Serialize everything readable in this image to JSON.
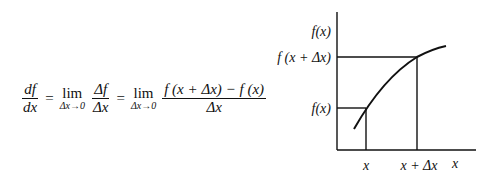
{
  "formula": {
    "lhs_num": "df",
    "lhs_den": "dx",
    "eq1": "=",
    "lim1_word": "lim",
    "lim1_sub": "Δx→0",
    "frac2_num": "Δf",
    "frac2_den": "Δx",
    "eq2": "=",
    "lim2_word": "lim",
    "lim2_sub": "Δx→0",
    "frac3_num": "f (x + Δx) − f (x)",
    "frac3_den": "Δx"
  },
  "graph": {
    "y_axis_label": "f(x)",
    "x_axis_label": "x",
    "y_tick_upper": "f (x + Δx)",
    "y_tick_lower": "f(x)",
    "x_tick_left": "x",
    "x_tick_right": "x + Δx"
  }
}
